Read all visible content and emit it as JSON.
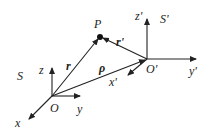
{
  "diagram": {
    "frames": [
      {
        "name": "S",
        "origin_label": "O",
        "axes": {
          "x": "x",
          "y": "y",
          "z": "z"
        }
      },
      {
        "name": "S'",
        "origin_label": "O'",
        "axes": {
          "x": "x'",
          "y": "y'",
          "z": "z'"
        }
      }
    ],
    "point_label": "P",
    "vectors": {
      "r": "r",
      "r_prime": "r'",
      "rho": "ρ"
    },
    "labels": {
      "S": "S",
      "S_prime": "S'",
      "O": "O",
      "O_prime": "O'",
      "x": "x",
      "y": "y",
      "z": "z",
      "x_prime": "x'",
      "y_prime": "y'",
      "z_prime": "z'",
      "P": "P",
      "r": "r",
      "r_prime": "r'",
      "rho": "ρ"
    },
    "colors": {
      "ink": "#222222",
      "background": "#ffffff"
    }
  }
}
